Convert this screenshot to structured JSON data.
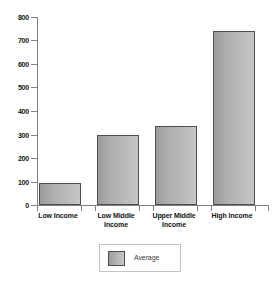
{
  "chart_data": {
    "type": "bar",
    "title": "",
    "subtitle": "",
    "xlabel": "",
    "ylabel": "",
    "categories": [
      "Low Income",
      "Low Middle Income",
      "Upper Middle Income",
      "High Income"
    ],
    "series": [
      {
        "name": "Average",
        "values": [
          95,
          300,
          337,
          745
        ]
      }
    ],
    "values": [
      95,
      300,
      337,
      745
    ],
    "ylim": [
      0,
      800
    ],
    "ytick_step": 100,
    "yticks": [
      "0",
      "100",
      "200",
      "300",
      "400",
      "500",
      "600",
      "700",
      "800"
    ],
    "grid": false,
    "legend_position": "bottom-center",
    "legend_entries": [
      "Average"
    ],
    "annotations": []
  },
  "legend": {
    "average_label": "Average"
  },
  "colors": {
    "bar_fill_dark": "#9a9a9a",
    "bar_fill_light": "#c6c6c6",
    "bar_outline": "#4d4d4d",
    "axis": "#808080",
    "text": "#141414",
    "legend_border": "#c2c2c2",
    "background": "#ffffff"
  }
}
